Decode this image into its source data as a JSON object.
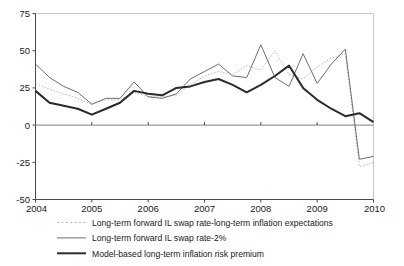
{
  "chart_data": {
    "type": "line",
    "title": "",
    "subtitle": "",
    "xlabel": "",
    "ylabel": "",
    "xlim": [
      2004,
      2010
    ],
    "ylim": [
      -50,
      75
    ],
    "yticks": [
      75,
      50,
      25,
      0,
      -25,
      -50
    ],
    "ytick_labels": [
      "75",
      "50",
      "25",
      "0",
      "-25",
      "-50"
    ],
    "xticks": [
      2004,
      2005,
      2006,
      2007,
      2008,
      2009,
      2010
    ],
    "xtick_labels": [
      "2004",
      "2005",
      "2006",
      "2007",
      "2008",
      "2009",
      "2010"
    ],
    "grid": false,
    "zero_line": 0,
    "legend_position": "below",
    "series": [
      {
        "name": "Long-term forward IL swap rate-long-term inflation expectations",
        "style": "dotted",
        "color": "#b9b9b9",
        "x": [
          2004.0,
          2004.25,
          2004.5,
          2004.75,
          2005.0,
          2005.25,
          2005.5,
          2005.75,
          2006.0,
          2006.25,
          2006.5,
          2006.75,
          2007.0,
          2007.25,
          2007.5,
          2007.75,
          2008.0,
          2008.25,
          2008.5,
          2008.75,
          2009.0,
          2009.25,
          2009.5,
          2009.75,
          2010.0
        ],
        "values": [
          28,
          24,
          21,
          18,
          14,
          17,
          17,
          22,
          19,
          19,
          20,
          27,
          33,
          36,
          34,
          40,
          37,
          50,
          34,
          31,
          39,
          45,
          48,
          -28,
          -25
        ]
      },
      {
        "name": "Long-term forward IL swap rate-2%",
        "style": "thin",
        "color": "#6e6e6e",
        "x": [
          2004.0,
          2004.25,
          2004.5,
          2004.75,
          2005.0,
          2005.25,
          2005.5,
          2005.75,
          2006.0,
          2006.25,
          2006.5,
          2006.75,
          2007.0,
          2007.25,
          2007.5,
          2007.75,
          2008.0,
          2008.25,
          2008.5,
          2008.75,
          2009.0,
          2009.25,
          2009.5,
          2009.75,
          2010.0
        ],
        "values": [
          41,
          32,
          26,
          22,
          14,
          18,
          18,
          29,
          19,
          18,
          21,
          31,
          36,
          41,
          33,
          32,
          54,
          32,
          26,
          48,
          28,
          41,
          51,
          -23,
          -21
        ]
      },
      {
        "name": "Model-based long-term inflation risk premium",
        "style": "thick",
        "color": "#2b2b2b",
        "x": [
          2004.0,
          2004.25,
          2004.5,
          2004.75,
          2005.0,
          2005.25,
          2005.5,
          2005.75,
          2006.0,
          2006.25,
          2006.5,
          2006.75,
          2007.0,
          2007.25,
          2007.5,
          2007.75,
          2008.0,
          2008.25,
          2008.5,
          2008.75,
          2009.0,
          2009.25,
          2009.5,
          2009.75,
          2010.0
        ],
        "values": [
          23,
          15,
          13,
          11,
          7,
          11,
          15,
          23,
          21,
          20,
          25,
          26,
          29,
          31,
          27,
          22,
          27,
          33,
          40,
          25,
          17,
          11,
          6,
          8,
          2
        ]
      }
    ]
  },
  "legend": {
    "items": [
      {
        "label": "Long-term forward IL swap rate-long-term inflation expectations",
        "style": "dotted"
      },
      {
        "label": "Long-term forward IL swap rate-2%",
        "style": "thin"
      },
      {
        "label": "Model-based long-term inflation risk premium",
        "style": "thick"
      }
    ]
  }
}
